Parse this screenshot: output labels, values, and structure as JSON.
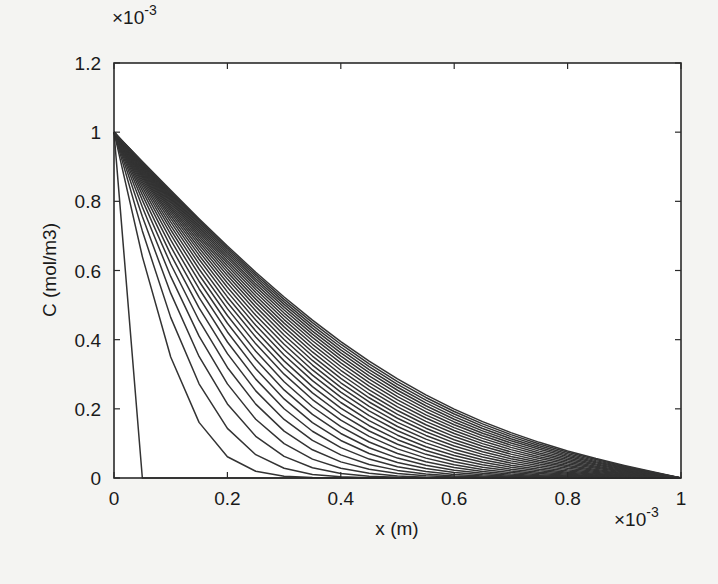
{
  "figure": {
    "background": "#f4f4f2",
    "plot_background": "#ffffff",
    "line_color": "#333333",
    "axis_color": "#2a2a2a"
  },
  "chart_data": {
    "type": "line",
    "title": "",
    "xlabel": "x (m)",
    "ylabel": "C (mol/m3)",
    "x_multiplier_label": "×10",
    "x_multiplier_exp": "-3",
    "y_multiplier_label": "×10",
    "y_multiplier_exp": "-3",
    "xlim": [
      0,
      1
    ],
    "ylim": [
      0,
      1.2
    ],
    "grid": false,
    "legend": "none",
    "x_ticks": [
      {
        "value": 0,
        "label": "0"
      },
      {
        "value": 0.2,
        "label": "0.2"
      },
      {
        "value": 0.4,
        "label": "0.4"
      },
      {
        "value": 0.6,
        "label": "0.6"
      },
      {
        "value": 0.8,
        "label": "0.8"
      },
      {
        "value": 1,
        "label": "1"
      }
    ],
    "y_ticks": [
      {
        "value": 0,
        "label": "0"
      },
      {
        "value": 0.2,
        "label": "0.2"
      },
      {
        "value": 0.4,
        "label": "0.4"
      },
      {
        "value": 0.6,
        "label": "0.6"
      },
      {
        "value": 0.8,
        "label": "0.8"
      },
      {
        "value": 1,
        "label": "1"
      },
      {
        "value": 1.2,
        "label": "1.2"
      }
    ],
    "units_note": "x in units of 1e-3 m, C in units of 1e-3 mol/m3",
    "boundary": {
      "C_at_x0": 1.0,
      "C_at_xL": 0.0
    },
    "mesh_x": [
      0,
      0.05,
      0.1,
      0.15,
      0.2,
      0.25,
      0.3,
      0.35,
      0.4,
      0.45,
      0.5,
      0.55,
      0.6,
      0.65,
      0.7,
      0.75,
      0.8,
      0.85,
      0.9,
      0.95,
      1.0
    ],
    "series": [
      {
        "name": "t0",
        "values": [
          1,
          0,
          0,
          0,
          0,
          0,
          0,
          0,
          0,
          0,
          0,
          0,
          0,
          0,
          0,
          0,
          0,
          0,
          0,
          0,
          0
        ]
      },
      {
        "name": "t1",
        "tau": 0.00572
      },
      {
        "name": "t2",
        "tau": 0.00934
      },
      {
        "name": "t3",
        "tau": 0.01296
      },
      {
        "name": "t4",
        "tau": 0.01658
      },
      {
        "name": "t5",
        "tau": 0.0202
      },
      {
        "name": "t6",
        "tau": 0.02382
      },
      {
        "name": "t7",
        "tau": 0.02744
      },
      {
        "name": "t8",
        "tau": 0.03106
      },
      {
        "name": "t9",
        "tau": 0.03468
      },
      {
        "name": "t10",
        "tau": 0.0383
      },
      {
        "name": "t11",
        "tau": 0.04192
      },
      {
        "name": "t12",
        "tau": 0.04554
      },
      {
        "name": "t13",
        "tau": 0.04916
      },
      {
        "name": "t14",
        "tau": 0.05278
      },
      {
        "name": "t15",
        "tau": 0.0564
      },
      {
        "name": "t16",
        "tau": 0.06002
      },
      {
        "name": "t17",
        "tau": 0.06364
      },
      {
        "name": "t18",
        "tau": 0.06726
      },
      {
        "name": "t19",
        "tau": 0.07088
      },
      {
        "name": "t20",
        "tau": 0.0745
      },
      {
        "name": "t21",
        "tau": 0.07812
      },
      {
        "name": "t22",
        "tau": 0.08174
      },
      {
        "name": "t23",
        "tau": 0.08536
      },
      {
        "name": "t24",
        "tau": 0.08898
      },
      {
        "name": "t25",
        "tau": 0.0926
      },
      {
        "name": "t26",
        "tau": 0.09622
      },
      {
        "name": "t27",
        "tau": 0.09984
      },
      {
        "name": "t28",
        "tau": 0.10346
      },
      {
        "name": "t29",
        "tau": 0.10708
      },
      {
        "name": "t30",
        "tau": 0.1107
      }
    ]
  }
}
